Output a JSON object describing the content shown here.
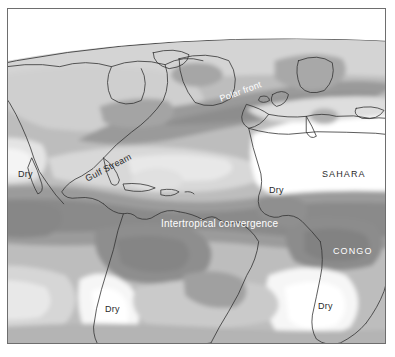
{
  "figure": {
    "kind": "map",
    "projection": "globe-perspective",
    "region": "Atlantic Ocean, North & South America, Europe, Africa",
    "border_color": "#6e6e6e",
    "background_color": "#ffffff"
  },
  "legend_scale": {
    "description": "Grayscale precipitation shading: white = driest, dark gray = wettest",
    "levels": [
      {
        "name": "driest",
        "color": "#ffffff"
      },
      {
        "name": "very-dry",
        "color": "#f2f2f2"
      },
      {
        "name": "dry",
        "color": "#e2e2e2"
      },
      {
        "name": "moderate",
        "color": "#cfcfcf"
      },
      {
        "name": "mid",
        "color": "#bdbdbd"
      },
      {
        "name": "wet",
        "color": "#a8a8a8"
      },
      {
        "name": "wetter",
        "color": "#969696"
      },
      {
        "name": "wettest",
        "color": "#848484"
      }
    ],
    "coastline_color": "#333333",
    "globe_edge_color": "#555555"
  },
  "labels": {
    "polar_front": {
      "text": "Polar front",
      "style": "white",
      "rotation": -20
    },
    "gulf_stream": {
      "text": "Gulf Stream",
      "style": "dark",
      "rotation": -27
    },
    "itcz": {
      "text": "Intertropical convergence",
      "style": "white",
      "rotation": 0
    },
    "sahara": {
      "text": "SAHARA",
      "style": "dark",
      "rotation": 0
    },
    "congo": {
      "text": "CONGO",
      "style": "white",
      "rotation": 0
    },
    "dry_baja": {
      "text": "Dry",
      "style": "dark",
      "rotation": 0
    },
    "dry_sahel": {
      "text": "Dry",
      "style": "dark",
      "rotation": 0
    },
    "dry_atacama": {
      "text": "Dry",
      "style": "dark",
      "rotation": 0
    },
    "dry_namib": {
      "text": "Dry",
      "style": "dark",
      "rotation": 0
    }
  }
}
